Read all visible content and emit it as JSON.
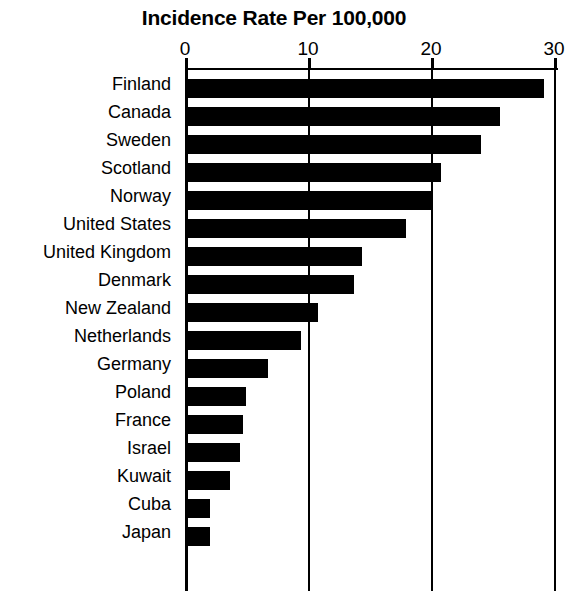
{
  "chart_data": {
    "type": "bar",
    "orientation": "horizontal",
    "title": "Incidence Rate Per 100,000",
    "xlabel": "",
    "ylabel": "",
    "xlim": [
      0,
      30
    ],
    "xticks": [
      0,
      10,
      20,
      30
    ],
    "xtick_labels": [
      "0",
      "10",
      "20",
      "30"
    ],
    "grid": true,
    "grid_axis": "x",
    "legend": false,
    "bar_color": "#000000",
    "background_color": "#ffffff",
    "note": "Right edge of figure is cropped; the '30' tick label is partially cut off.",
    "categories": [
      "Finland",
      "Canada",
      "Sweden",
      "Scotland",
      "Norway",
      "United States",
      "United Kingdom",
      "Denmark",
      "New Zealand",
      "Netherlands",
      "Germany",
      "Poland",
      "France",
      "Israel",
      "Kuwait",
      "Cuba",
      "Japan"
    ],
    "values": [
      28.9,
      25.3,
      23.8,
      20.6,
      19.8,
      17.8,
      14.2,
      13.6,
      10.7,
      9.3,
      6.7,
      4.9,
      4.7,
      4.4,
      3.6,
      2.0,
      2.0
    ]
  }
}
